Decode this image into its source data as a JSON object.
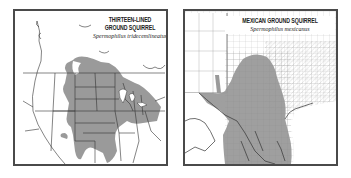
{
  "maps": [
    {
      "id": "thirteen-lined",
      "common_name_line1": "THIRTEEN-LINED",
      "common_name_line2": "GROUND SQUIRREL",
      "scientific_name": "Spermophilus tridecemlineatus",
      "region": "Central North America",
      "range_color": "#9a9a9a"
    },
    {
      "id": "mexican",
      "common_name": "MEXICAN GROUND SQUIRREL",
      "scientific_name": "Spermophilus mexicanus",
      "region": "Texas and northern Mexico",
      "range_color": "#9a9a9a"
    }
  ],
  "colors": {
    "frame": "#4a4a4a",
    "range": "#9a9a9a",
    "borders": "#333333",
    "county_lines": "#8a8a8a",
    "background": "#ffffff"
  }
}
